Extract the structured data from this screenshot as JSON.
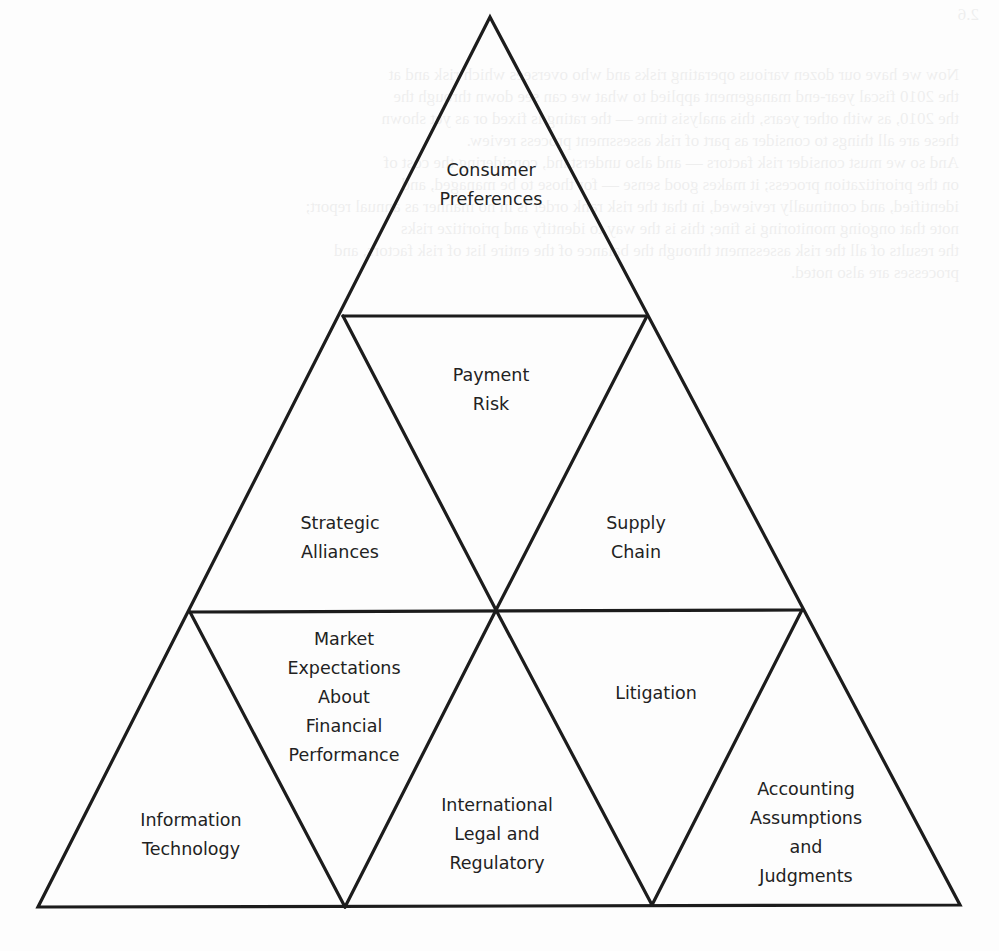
{
  "diagram": {
    "type": "triangular-grid-pyramid",
    "stroke_color": "#1c1c1c",
    "text_color": "#222222",
    "background": "#fdfdfd",
    "segments": [
      {
        "id": "consumer-preferences",
        "row": 1,
        "orientation": "up",
        "lines": [
          "Consumer",
          "Preferences"
        ]
      },
      {
        "id": "payment-risk",
        "row": 2,
        "orientation": "down",
        "lines": [
          "Payment",
          "Risk"
        ]
      },
      {
        "id": "strategic-alliances",
        "row": 2,
        "orientation": "up",
        "lines": [
          "Strategic",
          "Alliances"
        ]
      },
      {
        "id": "supply-chain",
        "row": 2,
        "orientation": "up",
        "lines": [
          "Supply",
          "Chain"
        ]
      },
      {
        "id": "market-expectations",
        "row": 3,
        "orientation": "down",
        "lines": [
          "Market",
          "Expectations",
          "About",
          "Financial",
          "Performance"
        ]
      },
      {
        "id": "litigation",
        "row": 3,
        "orientation": "down",
        "lines": [
          "Litigation"
        ]
      },
      {
        "id": "information-technology",
        "row": 3,
        "orientation": "up",
        "lines": [
          "Information",
          "Technology"
        ]
      },
      {
        "id": "international-legal",
        "row": 3,
        "orientation": "up",
        "lines": [
          "International",
          "Legal and",
          "Regulatory"
        ]
      },
      {
        "id": "accounting-assumptions",
        "row": 3,
        "orientation": "up",
        "lines": [
          "Accounting",
          "Assumptions",
          "and",
          "Judgments"
        ]
      }
    ]
  },
  "bleed_through_text": {
    "figure_ref": "2.6",
    "lines": [
      "Now we have our dozen various operating risks and who oversees which risk and at",
      "the 2010 fiscal year-end management applied to what we can see down through the",
      "the 2010, as with other years, this analysis time — the rating is fixed or as yet shown",
      "these are all things to consider as part of risk assessment process review.",
      "And so we must consider risk factors — and also understand, considering the cost of",
      "on the prioritization process; it makes good sense — for those to be managed, and",
      "identified, and continually reviewed, in that the risk rank order is in no manner as annual report;",
      "note that ongoing monitoring is fine; this is the way to identify and prioritize risks",
      "the results of all the risk assessment through the balance of the entire list of risk factors, and",
      "processes are also noted."
    ]
  }
}
